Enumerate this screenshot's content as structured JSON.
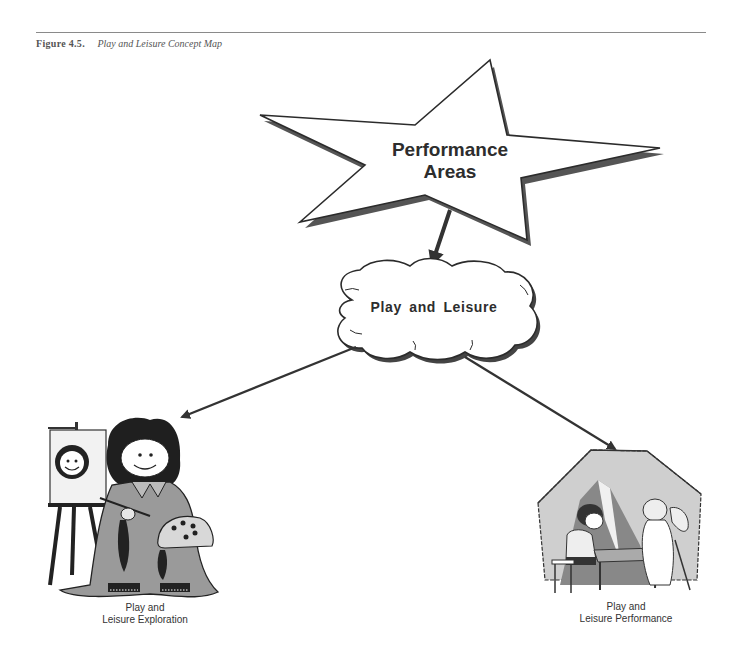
{
  "figure": {
    "number": "Figure 4.5.",
    "title": "Play and Leisure Concept Map"
  },
  "nodes": {
    "root": {
      "shape": "star",
      "line1": "Performance",
      "line2": "Areas"
    },
    "middle": {
      "shape": "cloud",
      "label": "Play and Leisure"
    },
    "left_leaf": {
      "illustration": "child-painting-at-easel",
      "line1": "Play and",
      "line2": "Leisure Exploration"
    },
    "right_leaf": {
      "illustration": "children-playing-in-tent",
      "line1": "Play and",
      "line2": "Leisure Performance"
    }
  },
  "edges": [
    {
      "from": "Performance Areas",
      "to": "Play and Leisure"
    },
    {
      "from": "Play and Leisure",
      "to": "Play and Leisure Exploration"
    },
    {
      "from": "Play and Leisure",
      "to": "Play and Leisure Performance"
    }
  ],
  "colors": {
    "ink": "#2b2b2b",
    "shade": "#9a9a9a",
    "light": "#cfcfcf",
    "rule": "#8a8a8a"
  }
}
